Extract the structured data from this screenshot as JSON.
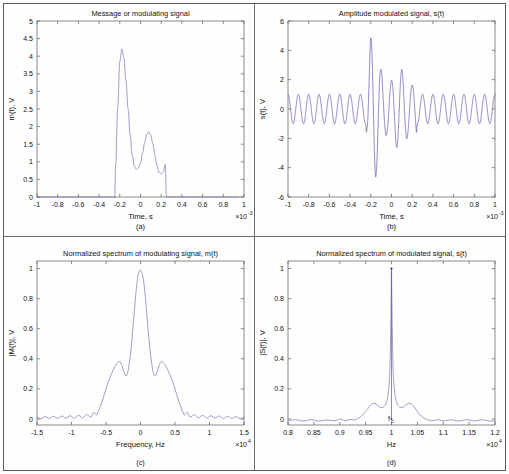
{
  "figure": {
    "background_color": "#fdfdfb",
    "frame_color": "#5a5a5a",
    "trace_color_thin": "#6a6ab4",
    "trace_color_carrier": "#2b2b96"
  },
  "panels": [
    {
      "id": "a",
      "caption": "(a)",
      "title": "Message or modulating signal",
      "xlabel": "Time, s",
      "ylabel": "m(t), V",
      "x_exponent": "×10",
      "x_exponent_sup": "-3",
      "xticks": [
        "-1",
        "-0.8",
        "-0.6",
        "-0.4",
        "-0.2",
        "0",
        "0.2",
        "0.4",
        "0.6",
        "0.8",
        "1"
      ],
      "yticks": [
        "0",
        "0.5",
        "1",
        "1.5",
        "2",
        "2.5",
        "3",
        "3.5",
        "4",
        "4.5",
        "5"
      ]
    },
    {
      "id": "b",
      "caption": "(b)",
      "title": "Amplitude modulated signal, s(t)",
      "xlabel": "Time, s",
      "ylabel": "s(t), V",
      "x_exponent": "×10",
      "x_exponent_sup": "-3",
      "xticks": [
        "-1",
        "-0.8",
        "-0.6",
        "-0.4",
        "-0.2",
        "0",
        "0.2",
        "0.4",
        "0.6",
        "0.8",
        "1"
      ],
      "yticks": [
        "-6",
        "-4",
        "-2",
        "0",
        "2",
        "4",
        "6"
      ]
    },
    {
      "id": "c",
      "caption": "(c)",
      "title": "Normalized spectrum of modulating signal, m(t)",
      "xlabel": "Frequency, Hz",
      "ylabel": "|M(f)|, V",
      "x_exponent": "×10",
      "x_exponent_sup": "4",
      "xticks": [
        "-1.5",
        "-1",
        "-0.5",
        "0",
        "0.5",
        "1",
        "1.5"
      ],
      "yticks": [
        "0",
        "0.2",
        "0.4",
        "0.6",
        "0.8",
        "1"
      ]
    },
    {
      "id": "d",
      "caption": "(d)",
      "title": "Normalized spectrum of modulated signal, s(t)",
      "xlabel": "Hz",
      "ylabel": "|S(f)|, V",
      "x_exponent": "×10",
      "x_exponent_sup": "4",
      "xticks": [
        "0.8",
        "0.85",
        "0.9",
        "0.95",
        "1",
        "1.05",
        "1.1",
        "1.15",
        "1.2"
      ],
      "yticks": [
        "0",
        "0.2",
        "0.4",
        "0.6",
        "0.8",
        "1"
      ],
      "annotation_fc": "f",
      "annotation_fc_sub": "c"
    }
  ],
  "chart_data": [
    {
      "type": "line",
      "panel": "a",
      "title": "Message or modulating signal",
      "xlabel": "Time, s",
      "ylabel": "m(t), V",
      "x_scale": "1e-3",
      "xlim": [
        -1,
        1
      ],
      "ylim": [
        0,
        5
      ],
      "grid": false,
      "legend": "none",
      "description": "Rectangular-windowed multitone message pulse, zero outside t in [-0.25e-3, 0.25e-3]",
      "points": {
        "x": [
          -1.0,
          -0.26,
          -0.25,
          -0.24,
          -0.22,
          -0.2,
          -0.18,
          -0.16,
          -0.14,
          -0.12,
          -0.1,
          -0.08,
          -0.06,
          -0.04,
          -0.02,
          0.0,
          0.02,
          0.04,
          0.06,
          0.08,
          0.1,
          0.12,
          0.14,
          0.16,
          0.18,
          0.2,
          0.22,
          0.24,
          0.25,
          0.26,
          1.0
        ],
        "y": [
          0.0,
          0.0,
          0.0,
          0.9,
          2.55,
          3.85,
          4.2,
          3.95,
          3.3,
          2.5,
          1.75,
          1.2,
          0.88,
          0.78,
          0.82,
          0.98,
          1.25,
          1.55,
          1.78,
          1.85,
          1.75,
          1.5,
          1.18,
          0.88,
          0.7,
          0.66,
          0.72,
          0.92,
          0.0,
          0.0,
          0.0
        ]
      }
    },
    {
      "type": "line",
      "panel": "b",
      "title": "Amplitude modulated signal, s(t)",
      "xlabel": "Time, s",
      "ylabel": "s(t), V",
      "x_scale": "1e-3",
      "xlim": [
        -1,
        1
      ],
      "ylim": [
        -6,
        6
      ],
      "grid": false,
      "legend": "none",
      "description": "AM waveform: carrier of amplitude 1 V at fc = 10 kHz, envelope = 1 + m(t); peak envelope ~5.1 V near t = -0.18 ms",
      "carrier_frequency_hz": 10000,
      "carrier_amplitude_v": 1.0,
      "envelope_points": {
        "x": [
          -1.0,
          -0.26,
          -0.25,
          -0.24,
          -0.22,
          -0.2,
          -0.18,
          -0.16,
          -0.14,
          -0.12,
          -0.1,
          -0.08,
          -0.06,
          -0.04,
          -0.02,
          0.0,
          0.02,
          0.04,
          0.06,
          0.08,
          0.1,
          0.12,
          0.14,
          0.16,
          0.18,
          0.2,
          0.22,
          0.24,
          0.25,
          0.26,
          1.0
        ],
        "y": [
          1.0,
          1.0,
          1.0,
          1.9,
          3.55,
          4.85,
          5.1,
          4.9,
          4.25,
          3.45,
          2.7,
          2.15,
          1.85,
          1.75,
          1.8,
          1.95,
          2.2,
          2.5,
          2.72,
          2.8,
          2.7,
          2.45,
          2.15,
          1.85,
          1.68,
          1.63,
          1.7,
          1.9,
          1.0,
          1.0,
          1.0
        ]
      }
    },
    {
      "type": "line",
      "panel": "c",
      "title": "Normalized spectrum of modulating signal, m(t)",
      "xlabel": "Frequency, Hz",
      "ylabel": "|M(f)|, V",
      "x_scale": "1e4",
      "xlim": [
        -1.5,
        1.5
      ],
      "ylim": [
        -0.04,
        1.05
      ],
      "grid": false,
      "legend": "none",
      "description": "Normalized baseband magnitude spectrum: main lobe at 0 Hz with value 1.0, secondary peaks ~0.38 at +/-0.3e4 Hz, notch ~0.28 at +/-0.2e4 Hz, low ripple beyond +/-0.62e4 Hz",
      "points": {
        "x": [
          -1.5,
          -1.44,
          -1.38,
          -1.32,
          -1.26,
          -1.2,
          -1.14,
          -1.08,
          -1.02,
          -0.96,
          -0.9,
          -0.84,
          -0.78,
          -0.72,
          -0.68,
          -0.64,
          -0.62,
          -0.58,
          -0.54,
          -0.5,
          -0.46,
          -0.42,
          -0.38,
          -0.34,
          -0.3,
          -0.27,
          -0.24,
          -0.21,
          -0.18,
          -0.14,
          -0.1,
          -0.06,
          -0.03,
          0.0,
          0.03,
          0.06,
          0.1,
          0.14,
          0.18,
          0.21,
          0.24,
          0.27,
          0.3,
          0.34,
          0.38,
          0.42,
          0.46,
          0.5,
          0.54,
          0.58,
          0.62,
          0.64,
          0.68,
          0.72,
          0.78,
          0.84,
          0.9,
          0.96,
          1.02,
          1.08,
          1.14,
          1.2,
          1.26,
          1.32,
          1.38,
          1.44,
          1.5
        ],
        "y": [
          0.012,
          0.002,
          0.016,
          0.004,
          0.018,
          0.004,
          0.02,
          0.006,
          0.022,
          0.006,
          0.024,
          0.008,
          0.03,
          0.012,
          0.045,
          0.028,
          0.04,
          0.085,
          0.14,
          0.2,
          0.255,
          0.3,
          0.34,
          0.37,
          0.382,
          0.355,
          0.315,
          0.285,
          0.32,
          0.45,
          0.66,
          0.87,
          0.965,
          0.99,
          0.955,
          0.86,
          0.65,
          0.45,
          0.32,
          0.285,
          0.315,
          0.355,
          0.382,
          0.37,
          0.34,
          0.3,
          0.255,
          0.2,
          0.14,
          0.085,
          0.04,
          0.028,
          0.045,
          0.012,
          0.03,
          0.008,
          0.024,
          0.006,
          0.022,
          0.006,
          0.02,
          0.004,
          0.018,
          0.004,
          0.016,
          0.002,
          0.012
        ]
      }
    },
    {
      "type": "line",
      "panel": "d",
      "title": "Normalized spectrum of modulated signal, s(t)",
      "xlabel": "Hz",
      "ylabel": "|S(f)|, V",
      "x_scale": "1e4",
      "xlim": [
        0.8,
        1.2
      ],
      "ylim": [
        -0.04,
        1.05
      ],
      "grid": false,
      "legend": "none",
      "description": "Normalized passband magnitude spectrum centered at the carrier fc = 1.0e4 Hz; carrier impulse normalized to 1.0, sideband peaks ~0.105 at +/-0.03e4 Hz offset",
      "carrier_marker_x": 1.0,
      "carrier_marker_y": 1.0,
      "points": {
        "x": [
          0.8,
          0.815,
          0.83,
          0.845,
          0.86,
          0.875,
          0.89,
          0.9,
          0.91,
          0.92,
          0.93,
          0.935,
          0.94,
          0.945,
          0.95,
          0.955,
          0.958,
          0.962,
          0.966,
          0.97,
          0.974,
          0.978,
          0.982,
          0.986,
          0.99,
          0.994,
          0.997,
          0.999,
          1.0,
          1.001,
          1.003,
          1.006,
          1.01,
          1.014,
          1.018,
          1.022,
          1.026,
          1.03,
          1.034,
          1.038,
          1.042,
          1.046,
          1.05,
          1.055,
          1.06,
          1.065,
          1.07,
          1.08,
          1.09,
          1.1,
          1.115,
          1.13,
          1.145,
          1.16,
          1.175,
          1.19,
          1.2
        ],
        "y": [
          -0.012,
          -0.005,
          -0.014,
          -0.004,
          -0.014,
          -0.006,
          -0.012,
          0.0,
          -0.012,
          -0.004,
          -0.006,
          0.004,
          0.014,
          0.03,
          0.05,
          0.072,
          0.088,
          0.1,
          0.104,
          0.1,
          0.088,
          0.078,
          0.075,
          0.085,
          0.11,
          0.18,
          0.34,
          0.72,
          1.0,
          0.72,
          0.34,
          0.18,
          0.11,
          0.085,
          0.075,
          0.078,
          0.088,
          0.1,
          0.104,
          0.1,
          0.088,
          0.07,
          0.048,
          0.028,
          0.012,
          0.002,
          -0.006,
          -0.012,
          -0.004,
          -0.013,
          -0.005,
          -0.014,
          -0.004,
          -0.013,
          -0.005,
          -0.014,
          -0.012
        ]
      }
    }
  ]
}
